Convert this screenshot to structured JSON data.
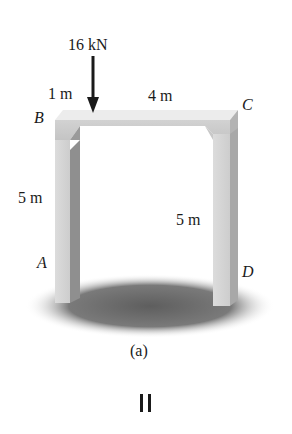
{
  "figure": {
    "load": {
      "label": "16 kN",
      "direction": "down"
    },
    "dimensions": {
      "left_span": "1 m",
      "right_span": "4 m",
      "left_height": "5 m",
      "right_height": "5 m"
    },
    "points": {
      "A": "A",
      "B": "B",
      "C": "C",
      "D": "D"
    },
    "caption": "(a)",
    "pause_symbol": "II"
  },
  "colors": {
    "beam_top": "#e6e6e6",
    "beam_front": "#cfcfcf",
    "pillar_front": "#d6d6d6",
    "pillar_side": "#a9a9a9",
    "shadow": "#6e6e6e",
    "ink": "#1a1a1a"
  }
}
